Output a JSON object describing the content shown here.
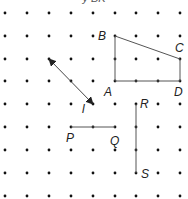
{
  "header_fragment": "y     BK",
  "grid": {
    "cols_x": [
      5,
      27,
      49,
      71,
      93,
      115,
      136,
      158,
      180
    ],
    "rows_y": [
      13,
      36,
      59,
      81,
      104,
      127,
      150,
      173,
      196
    ],
    "dot_color": "#111111",
    "dot_radius": 1.4
  },
  "line_color": "#555555",
  "shapes": {
    "quadrilateral": {
      "vertices": [
        {
          "label": "A",
          "x": 115,
          "y": 81
        },
        {
          "label": "B",
          "x": 115,
          "y": 36
        },
        {
          "label": "C",
          "x": 180,
          "y": 59
        },
        {
          "label": "D",
          "x": 180,
          "y": 81
        }
      ]
    },
    "line_l": {
      "label": "l",
      "x1": 49,
      "y1": 59,
      "x2": 93,
      "y2": 104,
      "double_arrow": true
    },
    "segment_PQ": {
      "p": {
        "label": "P",
        "x": 71,
        "y": 127
      },
      "q": {
        "label": "Q",
        "x": 115,
        "y": 127
      }
    },
    "segment_RS": {
      "r": {
        "label": "R",
        "x": 136,
        "y": 104
      },
      "s": {
        "label": "S",
        "x": 136,
        "y": 173
      }
    }
  },
  "labels": {
    "A": "A",
    "B": "B",
    "C": "C",
    "D": "D",
    "l": "l",
    "P": "P",
    "Q": "Q",
    "R": "R",
    "S": "S"
  }
}
